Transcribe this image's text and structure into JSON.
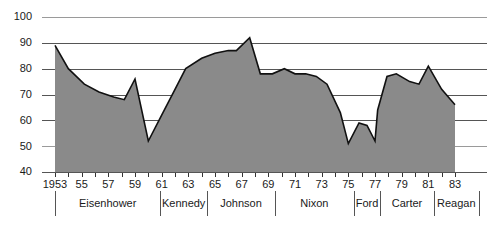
{
  "chart_data": {
    "type": "area",
    "title": "",
    "subtitle": "",
    "xlabel": "",
    "ylabel": "",
    "xlim": [
      1953,
      1983
    ],
    "ylim": [
      40,
      100
    ],
    "grid": true,
    "legend": false,
    "y_ticks": [
      40,
      50,
      60,
      70,
      80,
      90,
      100
    ],
    "y_tick_labels": [
      "40",
      "50",
      "60",
      "70",
      "80",
      "90",
      "100"
    ],
    "x_tick_values": [
      1953,
      1955,
      1957,
      1959,
      1961,
      1963,
      1965,
      1967,
      1969,
      1971,
      1973,
      1975,
      1977,
      1979,
      1981,
      1983
    ],
    "x_tick_labels": [
      "1953",
      "55",
      "57",
      "59",
      "61",
      "63",
      "65",
      "67",
      "69",
      "71",
      "73",
      "75",
      "77",
      "79",
      "81",
      "83"
    ],
    "x": [
      1953,
      1954,
      1955,
      1956,
      1957,
      1958,
      1959,
      1960,
      1961,
      1962,
      1963,
      1964,
      1965,
      1966,
      1967,
      1968,
      1969,
      1970,
      1971,
      1972,
      1973,
      1974,
      1975,
      1976,
      1977,
      1978,
      1979,
      1980,
      1981,
      1982,
      1983
    ],
    "values": [
      89,
      80,
      74,
      71,
      69,
      68,
      76,
      52,
      62,
      71,
      80,
      84,
      86,
      87,
      87,
      92,
      78,
      78,
      78,
      78,
      77,
      75,
      70,
      59,
      51,
      55,
      59,
      52,
      73,
      77,
      76
    ],
    "series": [
      {
        "name": "value",
        "points": [
          {
            "x": 1953.0,
            "y": 89
          },
          {
            "x": 1954.0,
            "y": 80
          },
          {
            "x": 1955.2,
            "y": 74
          },
          {
            "x": 1956.3,
            "y": 71
          },
          {
            "x": 1957.4,
            "y": 69
          },
          {
            "x": 1958.2,
            "y": 68
          },
          {
            "x": 1959.0,
            "y": 76
          },
          {
            "x": 1960.0,
            "y": 52
          },
          {
            "x": 1961.0,
            "y": 62
          },
          {
            "x": 1962.0,
            "y": 72
          },
          {
            "x": 1962.8,
            "y": 80
          },
          {
            "x": 1964.0,
            "y": 84
          },
          {
            "x": 1965.0,
            "y": 86
          },
          {
            "x": 1966.0,
            "y": 87
          },
          {
            "x": 1966.6,
            "y": 87
          },
          {
            "x": 1967.6,
            "y": 92
          },
          {
            "x": 1968.4,
            "y": 78
          },
          {
            "x": 1969.3,
            "y": 78
          },
          {
            "x": 1970.2,
            "y": 80
          },
          {
            "x": 1971.0,
            "y": 78
          },
          {
            "x": 1971.8,
            "y": 78
          },
          {
            "x": 1972.6,
            "y": 77
          },
          {
            "x": 1973.4,
            "y": 74
          },
          {
            "x": 1974.4,
            "y": 63
          },
          {
            "x": 1975.0,
            "y": 51
          },
          {
            "x": 1975.8,
            "y": 59
          },
          {
            "x": 1976.4,
            "y": 58
          },
          {
            "x": 1977.0,
            "y": 52
          },
          {
            "x": 1977.2,
            "y": 64
          },
          {
            "x": 1977.9,
            "y": 77
          },
          {
            "x": 1978.6,
            "y": 78
          },
          {
            "x": 1979.6,
            "y": 75
          },
          {
            "x": 1980.3,
            "y": 74
          },
          {
            "x": 1981.0,
            "y": 81
          },
          {
            "x": 1982.0,
            "y": 72
          },
          {
            "x": 1983.0,
            "y": 66
          }
        ]
      }
    ],
    "eras": [
      {
        "label": "Eisenhower",
        "start": 1953.0,
        "end": 1960.9
      },
      {
        "label": "Kennedy",
        "start": 1960.9,
        "end": 1964.4
      },
      {
        "label": "Johnson",
        "start": 1964.4,
        "end": 1969.5
      },
      {
        "label": "Nixon",
        "start": 1969.5,
        "end": 1975.4
      },
      {
        "label": "Ford",
        "start": 1975.4,
        "end": 1977.4
      },
      {
        "label": "Carter",
        "start": 1977.4,
        "end": 1981.4
      },
      {
        "label": "Reagan",
        "start": 1981.4,
        "end": 1984.8
      }
    ],
    "colors": {
      "area_fill": "#8a8a8a",
      "line": "#111111",
      "grid": "#555555",
      "text": "#1a1a1a",
      "background": "#ffffff"
    }
  }
}
